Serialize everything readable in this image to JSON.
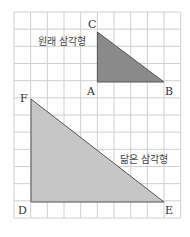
{
  "diagram": {
    "grid": {
      "x0": 14,
      "y0": 12,
      "cols": 10,
      "rows": 12,
      "cell": 16.67,
      "color": "#cfcfcf"
    },
    "original_triangle": {
      "label": "원래 삼각형",
      "fill": "#8a8a8a",
      "vertices": {
        "A": "A",
        "B": "B",
        "C": "C"
      }
    },
    "similar_triangle": {
      "label": "닮은 삼각형",
      "fill": "#c4c4c4",
      "vertices": {
        "D": "D",
        "E": "E",
        "F": "F"
      }
    }
  }
}
